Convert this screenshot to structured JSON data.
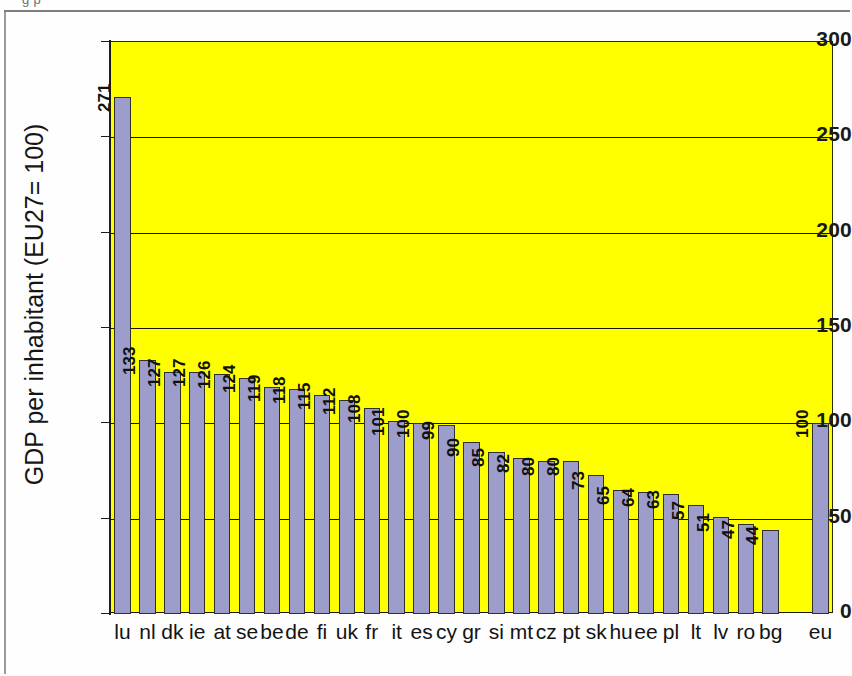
{
  "page": {
    "top_cut_text": "g                 p"
  },
  "chart_data": {
    "type": "bar",
    "title": "",
    "xlabel": "",
    "ylabel": "GDP per inhabitant (EU27= 100)",
    "ylim": [
      0,
      300
    ],
    "ytick_values": [
      0,
      50,
      100,
      150,
      200,
      250,
      300
    ],
    "ytick_labels": [
      "0",
      "50",
      "100",
      "150",
      "200",
      "250",
      "300"
    ],
    "grid": "horizontal",
    "legend": "none",
    "bar_color": "#9d9dcc",
    "plot_background": "#ffff00",
    "categories": [
      "lu",
      "nl",
      "dk",
      "ie",
      "at",
      "se",
      "be",
      "de",
      "fi",
      "uk",
      "fr",
      "it",
      "es",
      "cy",
      "gr",
      "si",
      "mt",
      "cz",
      "pt",
      "sk",
      "hu",
      "ee",
      "pl",
      "lt",
      "lv",
      "ro",
      "bg",
      "",
      "eu"
    ],
    "values": [
      271,
      133,
      127,
      127,
      126,
      124,
      119,
      118,
      115,
      112,
      108,
      101,
      100,
      99,
      90,
      85,
      82,
      80,
      80,
      73,
      65,
      64,
      63,
      57,
      51,
      47,
      44,
      null,
      100
    ],
    "value_labels": [
      "271",
      "133",
      "127",
      "127",
      "126",
      "124",
      "119",
      "118",
      "115",
      "112",
      "108",
      "101",
      "100",
      "99",
      "90",
      "85",
      "82",
      "80",
      "80",
      "73",
      "65",
      "64",
      "63",
      "57",
      "51",
      "47",
      "44",
      "",
      "100"
    ]
  }
}
